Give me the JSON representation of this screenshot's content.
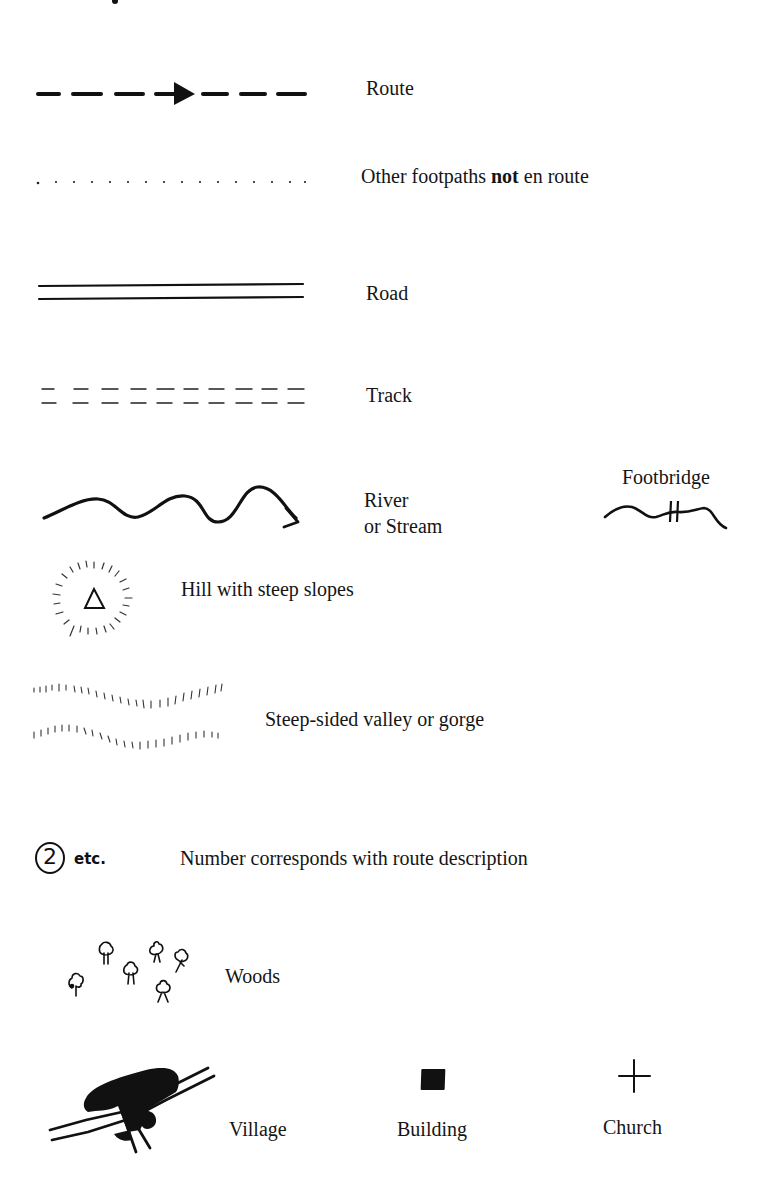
{
  "legend": {
    "title": "Key to maps",
    "items": [
      {
        "id": "route",
        "symbol": "dashed-line-with-arrow",
        "label": "Route"
      },
      {
        "id": "other-footpaths",
        "symbol": "dotted-line",
        "label_parts": [
          "Other footpaths ",
          "not",
          " en route"
        ],
        "label": "Other footpaths not en route"
      },
      {
        "id": "road",
        "symbol": "double-solid-line",
        "label": "Road"
      },
      {
        "id": "track",
        "symbol": "double-dashed-line",
        "label": "Track"
      },
      {
        "id": "river",
        "symbol": "wavy-line-with-arrow",
        "label_lines": [
          "River",
          "or Stream"
        ],
        "label": "River or Stream"
      },
      {
        "id": "footbridge",
        "symbol": "wavy-line-with-double-bar",
        "label": "Footbridge"
      },
      {
        "id": "hill",
        "symbol": "triangle-with-hachure-ring",
        "label": "Hill with steep slopes"
      },
      {
        "id": "valley",
        "symbol": "parallel-hachured-wavy-lines",
        "label": "Steep-sided valley or gorge"
      },
      {
        "id": "number",
        "symbol": "circled-number",
        "symbol_text": {
          "number": "2",
          "suffix": "etc."
        },
        "label": "Number corresponds with route description"
      },
      {
        "id": "woods",
        "symbol": "tree-cluster",
        "label": "Woods"
      },
      {
        "id": "village",
        "symbol": "black-blob-with-roads",
        "label": "Village"
      },
      {
        "id": "building",
        "symbol": "black-square",
        "label": "Building"
      },
      {
        "id": "church",
        "symbol": "cross",
        "label": "Church"
      }
    ]
  },
  "colors": {
    "ink": "#111111",
    "background": "#ffffff"
  }
}
